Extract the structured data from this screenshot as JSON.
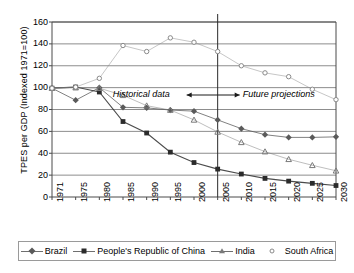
{
  "chart_data": {
    "type": "line",
    "title": "",
    "xlabel": "",
    "ylabel": "TPES per GDP (Indexed 1971=100)",
    "x": [
      1971,
      1975,
      1980,
      1985,
      1990,
      1995,
      2000,
      2005,
      2010,
      2015,
      2020,
      2025,
      2030
    ],
    "xticklabels": [
      "1971",
      "1975",
      "1980",
      "1985",
      "1990",
      "1995",
      "2000",
      "2005",
      "2010",
      "2015",
      "2020",
      "2025",
      "2030"
    ],
    "yticklabels": [
      "0",
      "20",
      "40",
      "60",
      "80",
      "100",
      "120",
      "140",
      "160"
    ],
    "ylim": [
      0,
      160
    ],
    "ytickstep": 20,
    "grid": "horizontal",
    "legend_position": "bottom",
    "series": [
      {
        "name": "Brazil",
        "marker": "diamond",
        "color": "#5a5a5a",
        "values": [
          99.5,
          88.5,
          100.0,
          82.0,
          81.5,
          79.5,
          78.5,
          70.5,
          62.5,
          57.0,
          54.5,
          54.5,
          55.0
        ]
      },
      {
        "name": "People's Republic of China",
        "marker": "square",
        "color": "#2b2b2b",
        "values": [
          99.5,
          100.5,
          96.0,
          69.0,
          58.5,
          41.0,
          31.5,
          25.5,
          21.0,
          17.0,
          14.5,
          12.5,
          10.5
        ]
      },
      {
        "name": "India",
        "marker": "triangle",
        "color": "#7a7a7a",
        "values": [
          99.5,
          100.0,
          99.5,
          93.0,
          83.5,
          79.5,
          70.5,
          59.5,
          50.0,
          41.5,
          34.5,
          29.0,
          24.0
        ]
      },
      {
        "name": "South Africa",
        "marker": "circle",
        "color": "#8a8a8a",
        "values": [
          99.5,
          100.5,
          108.5,
          138.5,
          133.0,
          145.5,
          141.5,
          133.0,
          120.0,
          113.5,
          110.0,
          98.5,
          89.0
        ]
      }
    ],
    "annotations": [
      {
        "text": "Historical data",
        "arrow": "right",
        "x_year": 1995
      },
      {
        "text": "Future projections",
        "arrow": "left",
        "x_year": 2013
      }
    ],
    "divider": {
      "x_year": 2005,
      "label": "2005"
    }
  },
  "legend": {
    "items": [
      {
        "label": "Brazil",
        "marker": "diamond"
      },
      {
        "label": "People's Republic of China",
        "marker": "square"
      },
      {
        "label": "India",
        "marker": "triangle"
      },
      {
        "label": "South Africa",
        "marker": "circle"
      }
    ]
  },
  "annotations": {
    "historical": "Historical data",
    "future": "Future projections"
  },
  "colors": {
    "brazil": "#5a5a5a",
    "china": "#2b2b2b",
    "india": "#7a7a7a",
    "south_africa": "#8a8a8a",
    "grid": "#808080",
    "axis": "#4a4a4a"
  }
}
